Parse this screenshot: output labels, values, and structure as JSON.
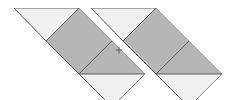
{
  "figure": {
    "background_color": "#ffffff",
    "colors": {
      "shaded_fill": "#b6b6b6",
      "light_fill": "#f0f0f0",
      "outline": "#5c5c5c",
      "tick_mark": "#6a6a6a"
    },
    "canvas": {
      "width": 236,
      "height": 100
    },
    "center_mark": {
      "name": "cross-tick",
      "glyph": "+",
      "x": 119,
      "y": 50
    },
    "pieces": [
      {
        "id": "left-top-triangle",
        "group": "left-half",
        "fill": "light",
        "points": "14,8 79,8 46,41"
      },
      {
        "id": "left-upper-square",
        "group": "left-half",
        "fill": "shaded",
        "points": "79,8 112,41 79,74 46,41"
      },
      {
        "id": "left-lower-square",
        "group": "left-half",
        "fill": "shaded",
        "points": "79,74 112,41 145,74 112,107"
      },
      {
        "id": "left-bottom-triangle",
        "group": "left-half",
        "fill": "light",
        "points": "79,74 145,74 112,107"
      },
      {
        "id": "right-top-triangle",
        "group": "right-half",
        "fill": "light",
        "points": "91,8 156,8 123,41"
      },
      {
        "id": "right-upper-square",
        "group": "right-half",
        "fill": "shaded",
        "points": "156,8 189,41 156,74 123,41"
      },
      {
        "id": "right-lower-square",
        "group": "right-half",
        "fill": "shaded",
        "points": "156,74 189,41 222,74 189,107"
      },
      {
        "id": "right-bottom-triangle",
        "group": "right-half",
        "fill": "light",
        "points": "156,74 222,74 189,107"
      }
    ]
  }
}
